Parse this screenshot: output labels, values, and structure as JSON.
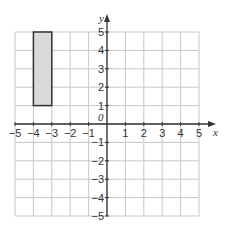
{
  "diagram": {
    "type": "coordinate-grid",
    "x_axis": {
      "label": "x",
      "min": -5,
      "max": 5,
      "ticks": [
        "-5",
        "-4",
        "-3",
        "-2",
        "-1",
        "1",
        "2",
        "3",
        "4",
        "5"
      ]
    },
    "y_axis": {
      "label": "y",
      "min": -5,
      "max": 5,
      "ticks": [
        "5",
        "4",
        "3",
        "2",
        "1",
        "-1",
        "-2",
        "-3",
        "-4",
        "-5"
      ]
    },
    "origin_label": "0",
    "shape": {
      "type": "rectangle",
      "x1": -4,
      "x2": -3,
      "y1": 1,
      "y2": 5,
      "fill": "#d9d9d9",
      "stroke": "#333333"
    },
    "colors": {
      "grid": "#c8c8c8",
      "axis": "#333333"
    }
  }
}
